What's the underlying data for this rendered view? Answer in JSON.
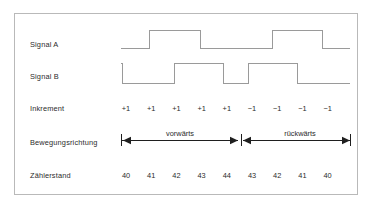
{
  "diagram": {
    "border_color": "#b9b9b9",
    "wave_color": "#9a9a9a",
    "text_color": "#2b2b2b",
    "arrow_color": "#1f1f1f",
    "rows": {
      "signal_a_label": "Signal A",
      "signal_b_label": "Signal B",
      "inkrement_label": "Inkrement",
      "bewegungsrichtung_label": "Bewegungsrichtung",
      "zaehlerstand_label": "Zählerstand"
    },
    "increments": [
      "+1",
      "+1",
      "+1",
      "+1",
      "+1",
      "−1",
      "−1",
      "−1",
      "−1"
    ],
    "counter_values": [
      "40",
      "41",
      "42",
      "43",
      "44",
      "43",
      "42",
      "41",
      "40"
    ],
    "directions": {
      "forward_label": "vorwärts",
      "backward_label": "rückwärts"
    }
  },
  "chart_data": {
    "type": "line",
    "xlabel": "",
    "ylabel": "",
    "series": [
      {
        "name": "Signal A",
        "type": "digital",
        "transitions": [
          {
            "x": 121,
            "level": 0
          },
          {
            "x": 149,
            "level": 1
          },
          {
            "x": 200,
            "level": 0
          },
          {
            "x": 272,
            "level": 1
          },
          {
            "x": 322,
            "level": 0
          },
          {
            "x": 350,
            "level": 0
          }
        ]
      },
      {
        "name": "Signal B",
        "type": "digital",
        "transitions": [
          {
            "x": 121,
            "level": 1
          },
          {
            "x": 122,
            "level": 0
          },
          {
            "x": 174,
            "level": 1
          },
          {
            "x": 223,
            "level": 0
          },
          {
            "x": 248,
            "level": 1
          },
          {
            "x": 297,
            "level": 0
          },
          {
            "x": 350,
            "level": 0
          }
        ]
      }
    ],
    "categories": [
      "1",
      "2",
      "3",
      "4",
      "5",
      "6",
      "7",
      "8",
      "9"
    ],
    "increment_values": [
      1,
      1,
      1,
      1,
      1,
      -1,
      -1,
      -1,
      -1
    ],
    "counter_values": [
      40,
      41,
      42,
      43,
      44,
      43,
      42,
      41,
      40
    ],
    "direction_segments": [
      {
        "label": "vorwärts",
        "from_index": 0,
        "to_index": 4
      },
      {
        "label": "rückwärts",
        "from_index": 5,
        "to_index": 8
      }
    ],
    "grid": false,
    "legend": "none"
  }
}
